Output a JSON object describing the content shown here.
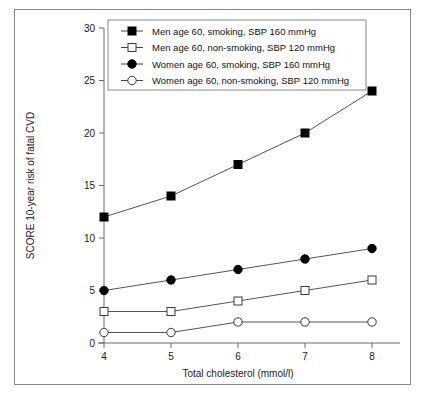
{
  "chart_data": {
    "type": "line",
    "title": "",
    "xlabel": "Total cholesterol (mmol/l)",
    "ylabel": "SCORE 10-year risk of fatal CVD",
    "x": [
      4,
      5,
      6,
      7,
      8
    ],
    "xtick_labels": [
      "4",
      "5",
      "6",
      "7",
      "8"
    ],
    "ytick_labels": [
      "0",
      "5",
      "10",
      "15",
      "20",
      "25",
      "30"
    ],
    "yticks": [
      0,
      5,
      10,
      15,
      20,
      25,
      30
    ],
    "xlim": [
      3.6,
      8.4
    ],
    "ylim": [
      0,
      30
    ],
    "grid": false,
    "legend_position": "top-center",
    "series": [
      {
        "name": "Men age 60, smoking, SBP 160 mmHg",
        "marker": "filled-square",
        "values": [
          12,
          14,
          17,
          20,
          24
        ]
      },
      {
        "name": "Men age 60, non-smoking, SBP 120 mmHg",
        "marker": "open-square",
        "values": [
          3,
          3,
          4,
          5,
          6
        ]
      },
      {
        "name": "Women age 60, smoking, SBP 160 mmHg",
        "marker": "filled-circle",
        "values": [
          5,
          6,
          7,
          8,
          9
        ]
      },
      {
        "name": "Women age 60, non-smoking, SBP 120 mmHg",
        "marker": "open-circle",
        "values": [
          1,
          1,
          2,
          2,
          2
        ]
      }
    ]
  },
  "colors": {
    "line": "#555555",
    "marker_fill": "#000000",
    "marker_open": "#ffffff",
    "axis": "#6b6b6b",
    "frame": "#8a8a8a",
    "text": "#111111"
  }
}
